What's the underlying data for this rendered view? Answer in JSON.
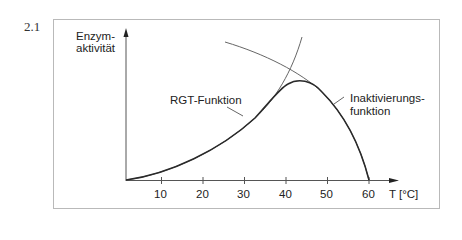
{
  "figure": {
    "number": "2.1",
    "y_axis_label_line1": "Enzym-",
    "y_axis_label_line2": "aktivität",
    "x_axis_label": "T [°C]",
    "x_ticks": [
      "10",
      "20",
      "30",
      "40",
      "50",
      "60"
    ],
    "rgt_label": "RGT-Funktion",
    "inactivation_label_line1": "Inaktivierungs-",
    "inactivation_label_line2": "funktion",
    "line_color": "#444444",
    "frame_color": "#b9b9b9"
  }
}
